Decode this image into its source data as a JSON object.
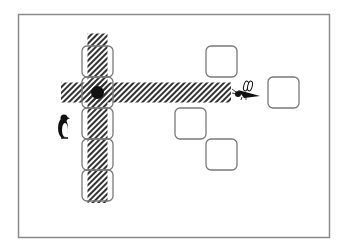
{
  "game": {
    "description": "Grid puzzle board with tiles, hatched path bands, a player dot, a penguin and a bee",
    "colors": {
      "background": "#ffffff",
      "frame": "#8a8a8a",
      "tile_stroke": "#7a7a7a",
      "hatch": "#333333",
      "ink": "#111111"
    },
    "grid": {
      "cols": 9,
      "rows": 6
    },
    "tiles": [
      {
        "id": "col-tile-1",
        "col": 2,
        "row": 1
      },
      {
        "id": "col-tile-2",
        "col": 2,
        "row": 2
      },
      {
        "id": "col-tile-3",
        "col": 2,
        "row": 3
      },
      {
        "id": "col-tile-4",
        "col": 2,
        "row": 4
      },
      {
        "id": "col-tile-5",
        "col": 2,
        "row": 5
      },
      {
        "id": "tile-upper",
        "col": 6,
        "row": 1
      },
      {
        "id": "tile-right",
        "col": 8,
        "row": 2
      },
      {
        "id": "tile-lower-left",
        "col": 5,
        "row": 3
      },
      {
        "id": "tile-lower-right",
        "col": 6,
        "row": 4
      }
    ],
    "hatch_bands": [
      {
        "id": "horizontal-band",
        "orientation": "horizontal",
        "row": 2,
        "from_col": 1,
        "to_col": 6
      },
      {
        "id": "vertical-band",
        "orientation": "vertical",
        "col": 2,
        "from_row": 0,
        "to_row": 5
      }
    ],
    "player": {
      "icon": "black-dot",
      "col": 2,
      "row": 2
    },
    "characters": [
      {
        "name": "penguin",
        "icon": "penguin-icon",
        "col": 1,
        "row": 3
      },
      {
        "name": "bee",
        "icon": "bee-icon",
        "col": 7,
        "row": 2
      }
    ]
  }
}
